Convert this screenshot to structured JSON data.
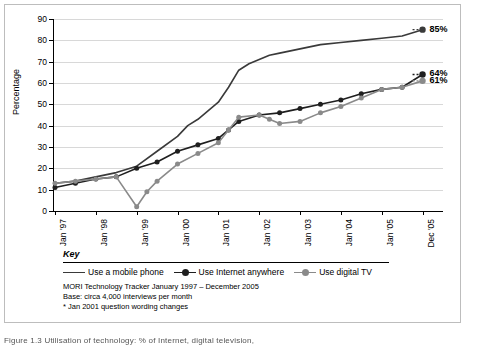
{
  "chart_data": {
    "type": "line",
    "title": "",
    "xlabel": "",
    "ylabel": "Percentage",
    "ylim": [
      0,
      90
    ],
    "yticks": [
      0,
      10,
      20,
      30,
      40,
      50,
      60,
      70,
      80,
      90
    ],
    "grid": "horizontal light",
    "legend_position": "below-plot",
    "categories": [
      "Jan '97",
      "Jan '98",
      "Jan '99",
      "Jan '00",
      "Jan '01",
      "Jan '02",
      "Jan '03",
      "Jan '04",
      "Jan '05",
      "Dec '05"
    ],
    "series": [
      {
        "name": "Use a mobile phone",
        "color": "#3a3a3a",
        "marker": "none",
        "end_label": "85%",
        "x": [
          0,
          0.5,
          1,
          1.5,
          2,
          2.5,
          3,
          3.25,
          3.5,
          4,
          4.25,
          4.5,
          4.75,
          5,
          5.25,
          5.5,
          6,
          6.5,
          7,
          7.5,
          8,
          8.5,
          9
        ],
        "values": [
          13,
          14,
          16,
          18,
          21,
          28,
          35,
          40,
          43,
          51,
          58,
          66,
          69,
          71,
          73,
          74,
          76,
          78,
          79,
          80,
          81,
          82,
          85
        ]
      },
      {
        "name": "Use Internet anywhere",
        "color": "#1f1f1f",
        "marker": "circle",
        "end_label": "64%",
        "x": [
          0,
          0.5,
          1,
          1.5,
          2,
          2.5,
          3,
          3.5,
          4,
          4.25,
          4.5,
          5,
          5.5,
          6,
          6.5,
          7,
          7.5,
          8,
          8.5,
          9
        ],
        "values": [
          11,
          13,
          15,
          16,
          20,
          23,
          28,
          31,
          34,
          38,
          42,
          45,
          46,
          48,
          50,
          52,
          55,
          57,
          58,
          64
        ]
      },
      {
        "name": "Use digital TV",
        "color": "#8a8a8a",
        "marker": "circle",
        "end_label": "61%",
        "x": [
          0,
          0.5,
          1,
          1.5,
          2,
          2.25,
          2.5,
          3,
          3.5,
          4,
          4.25,
          4.5,
          5,
          5.25,
          5.5,
          6,
          6.5,
          7,
          7.5,
          8,
          8.5,
          9
        ],
        "values": [
          13,
          14,
          15,
          16,
          2,
          9,
          14,
          22,
          27,
          32,
          38,
          44,
          45,
          43,
          41,
          42,
          46,
          49,
          53,
          57,
          58,
          61
        ]
      }
    ],
    "end_labels": [
      "85%",
      "64%",
      "61%"
    ]
  },
  "key": {
    "title": "Key",
    "items": [
      {
        "label": "Use a mobile phone",
        "color": "#3a3a3a",
        "marker": "none"
      },
      {
        "label": "Use Internet anywhere",
        "color": "#1f1f1f",
        "marker": "circle"
      },
      {
        "label": "Use digital TV",
        "color": "#8a8a8a",
        "marker": "circle"
      }
    ],
    "notes": [
      "MORI Technology Tracker January 1997 – December 2005",
      "Base: circa 4,000 interviews per month",
      "* Jan 2001 question wording changes"
    ]
  },
  "caption": "Figure 1.3  Utilisation of technology: % of Internet, digital television,",
  "axis": {
    "ylabel": "Percentage"
  }
}
